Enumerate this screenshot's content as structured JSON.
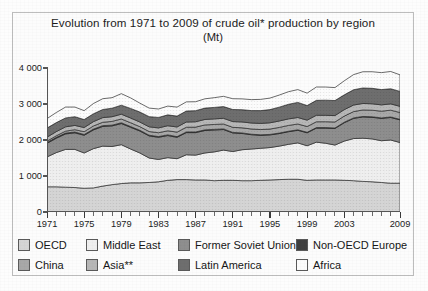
{
  "figure": {
    "title_line1": "Evolution from 1971 to 2009 of crude oil* production by region",
    "title_line2": "(Mt)"
  },
  "chart_data": {
    "type": "area",
    "stacked": true,
    "title": "Evolution from 1971 to 2009 of crude oil* production by region (Mt)",
    "subtitle": "(Mt)",
    "xlabel": "",
    "ylabel": "Mt",
    "xlim": [
      1971,
      2009
    ],
    "ylim": [
      0,
      4000
    ],
    "yticks": [
      0,
      1000,
      2000,
      3000,
      4000
    ],
    "ytick_labels": [
      "0",
      "1 000",
      "2 000",
      "3 000",
      "4 000"
    ],
    "xticks": [
      1971,
      1975,
      1979,
      1983,
      1987,
      1991,
      1995,
      1999,
      2003,
      2009
    ],
    "xtick_labels": [
      "1971",
      "1975",
      "1979",
      "1983",
      "1987",
      "1991",
      "1995",
      "1999",
      "2003",
      "2009"
    ],
    "x_minor_tick_interval": 1,
    "grid": false,
    "legend_position": "bottom",
    "x": [
      1971,
      1972,
      1973,
      1974,
      1975,
      1976,
      1977,
      1978,
      1979,
      1980,
      1981,
      1982,
      1983,
      1984,
      1985,
      1986,
      1987,
      1988,
      1989,
      1990,
      1991,
      1992,
      1993,
      1994,
      1995,
      1996,
      1997,
      1998,
      1999,
      2000,
      2001,
      2002,
      2003,
      2004,
      2005,
      2006,
      2007,
      2008,
      2009
    ],
    "series": [
      {
        "name": "OECD",
        "color": "#d5d5d5",
        "values": [
          700,
          700,
          690,
          680,
          660,
          670,
          720,
          760,
          790,
          810,
          810,
          820,
          840,
          880,
          900,
          900,
          890,
          890,
          870,
          880,
          880,
          870,
          870,
          880,
          890,
          900,
          910,
          910,
          880,
          890,
          890,
          890,
          880,
          870,
          850,
          840,
          820,
          800,
          800
        ]
      },
      {
        "name": "Middle East",
        "color": "#efefef",
        "values": [
          830,
          950,
          1050,
          1060,
          980,
          1090,
          1110,
          1060,
          1080,
          940,
          830,
          680,
          620,
          630,
          580,
          690,
          690,
          750,
          800,
          840,
          800,
          860,
          880,
          890,
          900,
          930,
          970,
          1010,
          960,
          1050,
          1020,
          970,
          1090,
          1170,
          1200,
          1190,
          1160,
          1200,
          1130
        ]
      },
      {
        "name": "Former Soviet Union",
        "color": "#8e8e8e",
        "values": [
          377,
          400,
          429,
          459,
          491,
          520,
          546,
          571,
          586,
          603,
          609,
          613,
          616,
          613,
          595,
          615,
          625,
          624,
          607,
          570,
          515,
          452,
          397,
          360,
          351,
          349,
          350,
          350,
          360,
          390,
          420,
          460,
          510,
          560,
          590,
          600,
          620,
          625,
          630
        ]
      },
      {
        "name": "Non-OECD Europe",
        "color": "#3f3f3f",
        "values": [
          22,
          23,
          23,
          23,
          23,
          23,
          23,
          22,
          22,
          21,
          20,
          20,
          20,
          19,
          19,
          19,
          19,
          18,
          18,
          17,
          16,
          15,
          14,
          14,
          14,
          14,
          14,
          14,
          14,
          14,
          14,
          14,
          14,
          14,
          14,
          14,
          14,
          14,
          14
        ]
      },
      {
        "name": "China",
        "color": "#a8a8a8",
        "values": [
          39,
          45,
          54,
          65,
          77,
          87,
          94,
          104,
          106,
          106,
          101,
          102,
          106,
          114,
          125,
          131,
          134,
          137,
          137,
          138,
          141,
          142,
          145,
          146,
          149,
          157,
          161,
          161,
          160,
          163,
          164,
          167,
          170,
          175,
          181,
          184,
          186,
          190,
          189
        ]
      },
      {
        "name": "Asia**",
        "color": "#b7b7b7",
        "values": [
          110,
          115,
          120,
          118,
          115,
          120,
          128,
          130,
          133,
          131,
          129,
          131,
          134,
          140,
          143,
          145,
          149,
          152,
          155,
          158,
          160,
          163,
          166,
          170,
          174,
          178,
          182,
          180,
          178,
          180,
          178,
          177,
          180,
          182,
          180,
          178,
          176,
          174,
          172
        ]
      },
      {
        "name": "Latin America",
        "color": "#6e6e6e",
        "values": [
          253,
          250,
          247,
          242,
          222,
          218,
          226,
          236,
          250,
          266,
          277,
          283,
          290,
          302,
          302,
          305,
          308,
          315,
          318,
          325,
          335,
          340,
          345,
          356,
          366,
          385,
          405,
          420,
          405,
          415,
          420,
          418,
          410,
          425,
          430,
          430,
          425,
          420,
          415
        ]
      },
      {
        "name": "Africa",
        "color": "#fcfcfc",
        "values": [
          263,
          280,
          302,
          268,
          247,
          286,
          300,
          292,
          320,
          292,
          247,
          237,
          235,
          243,
          250,
          254,
          248,
          258,
          270,
          285,
          300,
          300,
          305,
          312,
          320,
          335,
          350,
          355,
          345,
          370,
          365,
          360,
          390,
          420,
          450,
          460,
          470,
          480,
          460
        ]
      }
    ]
  },
  "legend": {
    "items": [
      {
        "label": "OECD",
        "color": "#d5d5d5",
        "row": 0,
        "col": 0
      },
      {
        "label": "Middle East",
        "color": "#efefef",
        "row": 0,
        "col": 1
      },
      {
        "label": "Former Soviet Union",
        "color": "#8e8e8e",
        "row": 0,
        "col": 2
      },
      {
        "label": "Non-OECD Europe",
        "color": "#3f3f3f",
        "row": 0,
        "col": 3
      },
      {
        "label": "China",
        "color": "#a8a8a8",
        "row": 1,
        "col": 0
      },
      {
        "label": "Asia**",
        "color": "#b7b7b7",
        "row": 1,
        "col": 1
      },
      {
        "label": "Latin America",
        "color": "#6e6e6e",
        "row": 1,
        "col": 2
      },
      {
        "label": "Africa",
        "color": "#fcfcfc",
        "row": 1,
        "col": 3
      }
    ]
  }
}
